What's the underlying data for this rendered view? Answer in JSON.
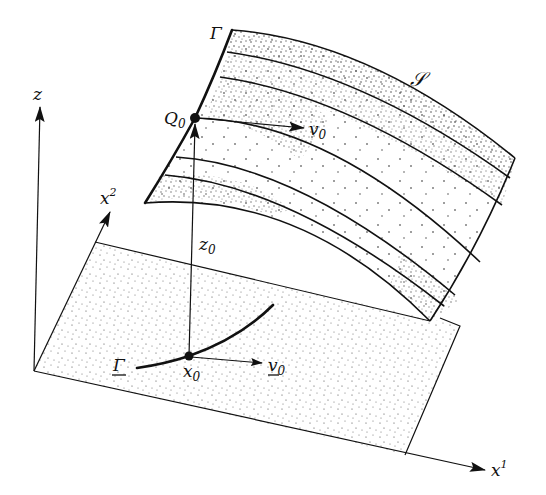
{
  "figure": {
    "colors": {
      "ink": "#111111",
      "background": "#ffffff"
    },
    "labels": {
      "z_axis": "z",
      "x1_axis": "x",
      "x1_sup": "1",
      "x2_axis": "x",
      "x2_sup": "2",
      "surface": "𝒮",
      "gamma_surface": "Γ",
      "gamma_plane": "Γ",
      "Q0": "Q",
      "Q0_sub": "0",
      "v0": "v",
      "v0_sub": "0",
      "v0_plane": "v",
      "v0_plane_sub": "0",
      "z0": "z",
      "z0_sub": "0",
      "x0": "x",
      "x0_sub": "0"
    }
  }
}
